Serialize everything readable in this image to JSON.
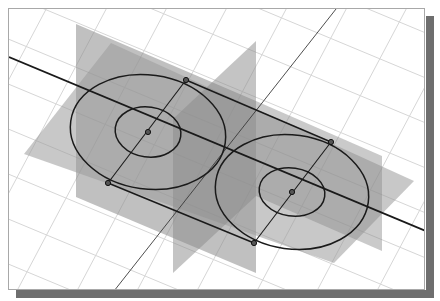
{
  "figure": {
    "colors": {
      "background": "#ffffff",
      "grid": "#d8d8d8",
      "frame_shadow": "#6e6e6e",
      "plane_vertical_left": "#8c8c8c",
      "plane_horizontal": "#9a9a9a",
      "plane_vertical_middle": "#8a8a8a",
      "sketch_line": "#1a1a1a",
      "axis_line": "#3a3a3a"
    },
    "sketch": {
      "circle_left": {
        "cx": 147,
        "cy": 131,
        "outer_rx": 78,
        "outer_ry": 58,
        "inner_rx": 33,
        "inner_ry": 25
      },
      "circle_right": {
        "cx": 291,
        "cy": 191,
        "outer_rx": 77,
        "outer_ry": 58,
        "inner_rx": 33,
        "inner_ry": 24
      },
      "tangent_points": [
        [
          185,
          79
        ],
        [
          107,
          182
        ],
        [
          330,
          141
        ],
        [
          253,
          242
        ]
      ],
      "center_points": [
        [
          147,
          131
        ],
        [
          291,
          191
        ]
      ]
    }
  }
}
